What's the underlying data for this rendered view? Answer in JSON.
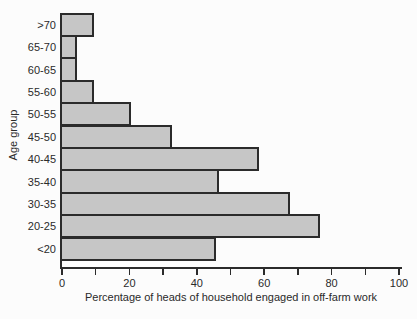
{
  "figure": {
    "background": "#fcfcfc"
  },
  "chart_data": {
    "type": "bar",
    "orientation": "horizontal",
    "categories": [
      ">70",
      "65-70",
      "60-65",
      "55-60",
      "50-55",
      "45-50",
      "40-45",
      "35-40",
      "30-35",
      "20-25",
      "<20"
    ],
    "values": [
      9,
      4,
      4,
      9,
      20,
      32,
      58,
      46,
      67,
      76,
      45
    ],
    "xlabel": "Percentage of heads of household engaged in off-farm work",
    "ylabel": "Age group",
    "xlim": [
      0,
      100
    ],
    "x_tick_step": 10,
    "x_labeled_ticks": [
      0,
      20,
      40,
      60,
      80,
      100
    ],
    "grid": "off",
    "legend": "none",
    "bar_fill": "#c6c6c6",
    "bar_border": "#2b2b2b",
    "axis_color": "#2b2b2b",
    "text_color": "#2a2a2a"
  }
}
